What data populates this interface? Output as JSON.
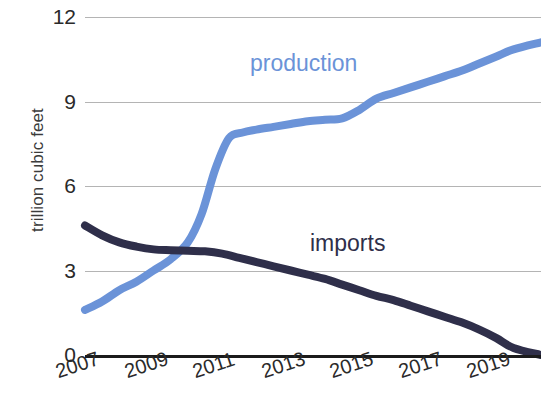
{
  "chart_data": {
    "type": "line",
    "title": "",
    "subtitle": "",
    "xlabel": "",
    "ylabel": "trillion cubic feet",
    "x_tick_labels": [
      "2007",
      "2009",
      "2011",
      "2013",
      "2015",
      "2017",
      "2019"
    ],
    "x_tick_values": [
      2007,
      2009,
      2011,
      2013,
      2015,
      2017,
      2019
    ],
    "y_tick_labels": [
      "0",
      "3",
      "6",
      "9",
      "12"
    ],
    "y_tick_values": [
      0,
      3,
      6,
      9,
      12
    ],
    "xlim": [
      2007,
      2020.3
    ],
    "ylim": [
      0,
      12
    ],
    "grid": "horizontal",
    "legend": "inline-labels",
    "colors": {
      "production": "#6b93d8",
      "imports": "#2f2f4a",
      "gridline": "#b4b4b4",
      "axis": "#1b1b1b",
      "background": "#ffffff"
    },
    "series": [
      {
        "name": "production",
        "label": "production",
        "color": "#6b93d8",
        "x": [
          2007,
          2007.5,
          2008,
          2008.5,
          2009,
          2009.5,
          2010,
          2010.4,
          2010.8,
          2011.2,
          2011.6,
          2012,
          2012.5,
          2013,
          2013.5,
          2014,
          2014.5,
          2015,
          2015.5,
          2016,
          2016.5,
          2017,
          2017.5,
          2018,
          2018.5,
          2019,
          2019.5,
          2020.3
        ],
        "y": [
          1.6,
          1.9,
          2.3,
          2.6,
          3.0,
          3.4,
          4.0,
          5.0,
          6.6,
          7.7,
          7.9,
          8.0,
          8.1,
          8.2,
          8.3,
          8.35,
          8.4,
          8.7,
          9.1,
          9.3,
          9.5,
          9.7,
          9.9,
          10.1,
          10.35,
          10.6,
          10.85,
          11.1
        ]
      },
      {
        "name": "imports",
        "label": "imports",
        "color": "#2f2f4a",
        "x": [
          2007,
          2007.5,
          2008,
          2008.5,
          2009,
          2009.5,
          2010,
          2010.5,
          2011,
          2011.5,
          2012,
          2012.5,
          2013,
          2013.5,
          2014,
          2014.5,
          2015,
          2015.5,
          2016,
          2016.5,
          2017,
          2017.5,
          2018,
          2018.5,
          2019,
          2019.5,
          2020.3
        ],
        "y": [
          4.6,
          4.25,
          4.0,
          3.85,
          3.75,
          3.72,
          3.7,
          3.68,
          3.6,
          3.45,
          3.3,
          3.15,
          3.0,
          2.85,
          2.7,
          2.5,
          2.3,
          2.1,
          1.95,
          1.75,
          1.55,
          1.35,
          1.15,
          0.9,
          0.6,
          0.25,
          0.0
        ]
      }
    ]
  },
  "axis": {
    "y_title": "trillion cubic feet"
  }
}
